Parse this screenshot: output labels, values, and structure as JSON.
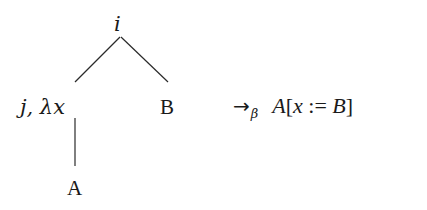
{
  "diagram": {
    "type": "tree-with-rewrite-rule",
    "tree": {
      "root": {
        "label": "i"
      },
      "left_child": {
        "label": "j, λx"
      },
      "right_child": {
        "label": "B"
      },
      "leaf": {
        "label": "A"
      }
    },
    "edges": [
      {
        "from": "root",
        "to": "left_child"
      },
      {
        "from": "root",
        "to": "right_child"
      },
      {
        "from": "left_child",
        "to": "leaf"
      }
    ],
    "rule": {
      "arrow": "→",
      "subscript": "β",
      "result_head": "A",
      "result_open": "[",
      "result_var": "x",
      "result_op": " := ",
      "result_arg": "B",
      "result_close": "]"
    }
  }
}
